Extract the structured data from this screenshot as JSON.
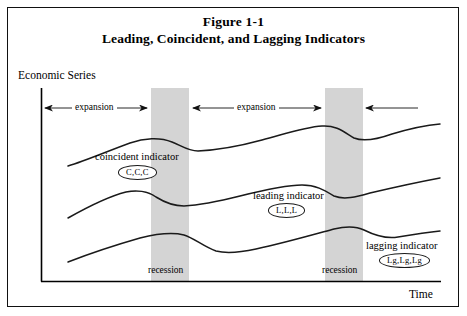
{
  "figure": {
    "title_line_1": "Figure 1-1",
    "title_line_2": "Leading, Coincident, and Lagging Indicators"
  },
  "axes": {
    "y_label": "Economic Series",
    "x_label": "Time"
  },
  "annotations": {
    "expansion_1": "expansion",
    "expansion_2": "expansion",
    "recession_1": "recession",
    "recession_2": "recession"
  },
  "series_labels": {
    "coincident": "coincident indicator",
    "coincident_tag": "C,C,C",
    "leading": "leading indicator",
    "leading_tag": "L,L,L",
    "lagging": "lagging indicator",
    "lagging_tag": "Lg,Lg,Lg"
  },
  "colors": {
    "recession_band": "#d4d4d4",
    "curve": "#1a1a1a",
    "axis": "#000000",
    "background": "#ffffff",
    "frame": "#111111"
  },
  "chart_data": {
    "type": "line",
    "title": "Leading, Coincident, and Lagging Indicators",
    "xlabel": "Time",
    "ylabel": "Economic Series",
    "grid": false,
    "legend": "inline-annotations",
    "axis_pixels": {
      "x_origin": 41,
      "y_origin": 281,
      "x_end": 441,
      "y_top": 88
    },
    "recession_bands": [
      {
        "label": "recession",
        "x_start": 151,
        "x_end": 189
      },
      {
        "label": "recession",
        "x_start": 325,
        "x_end": 363
      }
    ],
    "expansion_spans": [
      {
        "label": "expansion",
        "x_start": 43,
        "x_end": 150
      },
      {
        "label": "expansion",
        "x_start": 190,
        "x_end": 324
      },
      {
        "label": "expansion",
        "x_start": 364,
        "x_end": 418,
        "truncated": true
      }
    ],
    "series": [
      {
        "name": "coincident indicator",
        "tag": "C,C,C",
        "description": "Turns at the same time as the recession bands begin and end",
        "points": [
          [
            68,
            166
          ],
          [
            95,
            157
          ],
          [
            122,
            147
          ],
          [
            150,
            139
          ],
          [
            168,
            139
          ],
          [
            183,
            147
          ],
          [
            196,
            152
          ],
          [
            215,
            150
          ],
          [
            250,
            143
          ],
          [
            285,
            133
          ],
          [
            315,
            126
          ],
          [
            332,
            126
          ],
          [
            348,
            134
          ],
          [
            362,
            140
          ],
          [
            385,
            136
          ],
          [
            412,
            129
          ],
          [
            440,
            124
          ]
        ]
      },
      {
        "name": "leading indicator",
        "tag": "L,L,L",
        "description": "Turns down before the recession begins and up before it ends",
        "points": [
          [
            68,
            218
          ],
          [
            95,
            205
          ],
          [
            118,
            195
          ],
          [
            136,
            192
          ],
          [
            152,
            194
          ],
          [
            168,
            202
          ],
          [
            182,
            206
          ],
          [
            200,
            204
          ],
          [
            235,
            197
          ],
          [
            270,
            190
          ],
          [
            295,
            185
          ],
          [
            312,
            185
          ],
          [
            330,
            192
          ],
          [
            347,
            198
          ],
          [
            370,
            194
          ],
          [
            405,
            184
          ],
          [
            440,
            178
          ]
        ]
      },
      {
        "name": "lagging indicator",
        "tag": "Lg,Lg,Lg",
        "description": "Turns down after the recession begins and up after it ends",
        "points": [
          [
            68,
            262
          ],
          [
            95,
            253
          ],
          [
            125,
            243
          ],
          [
            155,
            236
          ],
          [
            180,
            234
          ],
          [
            196,
            236
          ],
          [
            212,
            245
          ],
          [
            230,
            252
          ],
          [
            252,
            250
          ],
          [
            285,
            243
          ],
          [
            318,
            233
          ],
          [
            345,
            227
          ],
          [
            360,
            227
          ],
          [
            375,
            233
          ],
          [
            392,
            238
          ],
          [
            415,
            235
          ],
          [
            440,
            231
          ]
        ]
      }
    ]
  }
}
